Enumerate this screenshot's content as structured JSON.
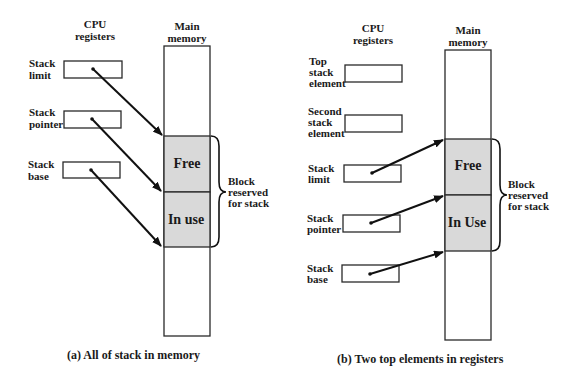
{
  "colors": {
    "block_fill": "#d9d9d9",
    "line": "#2a2a2a",
    "background": "#ffffff"
  },
  "panel_a": {
    "registers_header": [
      "CPU",
      "registers"
    ],
    "memory_header": [
      "Main",
      "memory"
    ],
    "registers": [
      {
        "label": [
          "Stack",
          "limit"
        ]
      },
      {
        "label": [
          "Stack",
          "pointer"
        ]
      },
      {
        "label": [
          "Stack",
          "base"
        ]
      }
    ],
    "blocks": {
      "free": "Free",
      "in_use": "In use"
    },
    "brace_label": [
      "Block",
      "reserved",
      "for stack"
    ],
    "caption": "(a) All of stack in memory"
  },
  "panel_b": {
    "registers_header": [
      "CPU",
      "registers"
    ],
    "memory_header": [
      "Main",
      "memory"
    ],
    "registers": [
      {
        "label": [
          "Top",
          "stack",
          "element"
        ]
      },
      {
        "label": [
          "Second",
          "stack",
          "element"
        ]
      },
      {
        "label": [
          "Stack",
          "limit"
        ]
      },
      {
        "label": [
          "Stack",
          "pointer"
        ]
      },
      {
        "label": [
          "Stack",
          "base"
        ]
      }
    ],
    "blocks": {
      "free": "Free",
      "in_use": "In Use"
    },
    "brace_label": [
      "Block",
      "reserved",
      "for stack"
    ],
    "caption": "(b) Two top elements in registers"
  }
}
